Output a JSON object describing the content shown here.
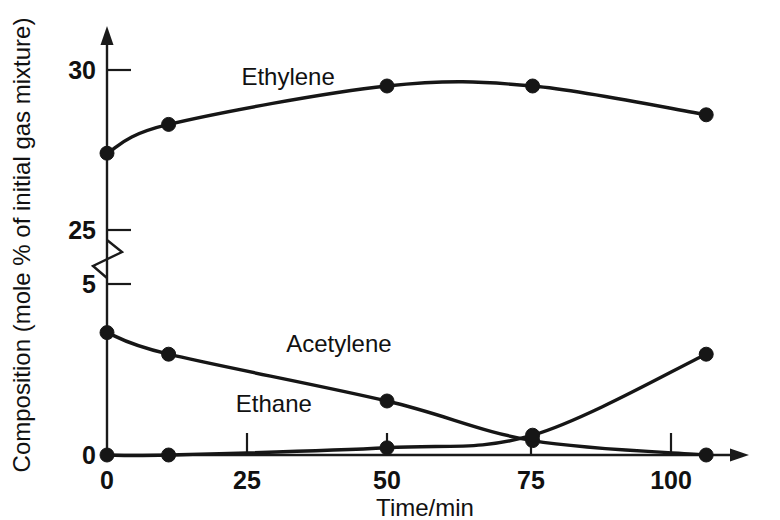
{
  "chart_data": {
    "type": "line",
    "title": "",
    "subtitle": "",
    "xlabel": "Time/min",
    "ylabel": "Composition (mole % of initial gas mixture)",
    "xlim": [
      0,
      114
    ],
    "xticks": [
      "0",
      "25",
      "50",
      "75",
      "100"
    ],
    "xtick_values": [
      0,
      25,
      50,
      75,
      100
    ],
    "yticks_upper": [
      "30",
      "25"
    ],
    "ytick_upper_values": [
      30,
      25
    ],
    "yticks_lower": [
      "5",
      "0"
    ],
    "ytick_lower_values": [
      5,
      0
    ],
    "y_axis_break": true,
    "y_break_note": "broken axis between 5 and 25",
    "grid": false,
    "legend": "inline-labels",
    "x": [
      0,
      11,
      50,
      76,
      107
    ],
    "series": [
      {
        "name": "Ethylene",
        "values": [
          27.4,
          28.3,
          29.5,
          29.5,
          28.6
        ],
        "label_x": 24,
        "label_y_px": 85
      },
      {
        "name": "Acetylene",
        "values": [
          3.4,
          2.8,
          1.5,
          0.4,
          0.0
        ],
        "label_x": 32,
        "label_y_px": 352
      },
      {
        "name": "Ethane",
        "values": [
          0.0,
          0.0,
          0.2,
          0.55,
          2.8
        ],
        "label_x": 23,
        "label_y_px": 412
      }
    ]
  },
  "axis": {
    "x_label": "Time/min",
    "y_label": "Composition (mole % of initial gas mixture)",
    "x_tick_0": "0",
    "x_tick_25": "25",
    "x_tick_50": "50",
    "x_tick_75": "75",
    "x_tick_100": "100",
    "y_tick_30": "30",
    "y_tick_25": "25",
    "y_tick_5": "5",
    "y_tick_0": "0"
  },
  "series_labels": {
    "ethylene": "Ethylene",
    "acetylene": "Acetylene",
    "ethane": "Ethane"
  },
  "colors": {
    "ink": "#161616",
    "background": "#ffffff"
  }
}
